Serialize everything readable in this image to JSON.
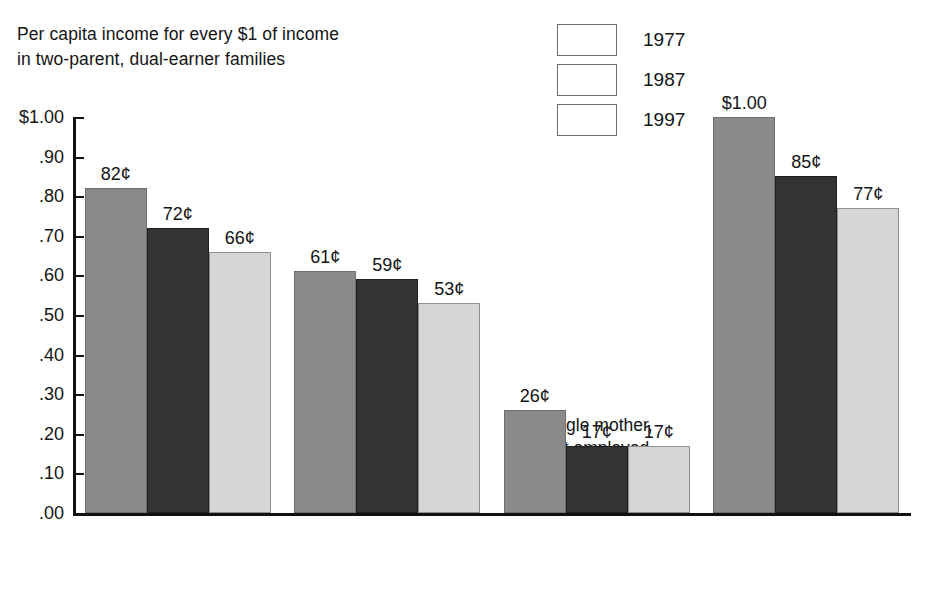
{
  "chart_data": {
    "type": "bar",
    "title": "Per capita income for every $1 of income in two-parent, dual-earner families",
    "title_lines": [
      "Per capita income for every $1 of income",
      "in two-parent, dual-earner families"
    ],
    "xlabel": "",
    "ylabel": "",
    "ylim": [
      0,
      1.0
    ],
    "grid": false,
    "legend_position": "top-center",
    "ytick_labels": [
      "$1.00",
      ".90",
      ".80",
      ".70",
      ".60",
      ".50",
      ".40",
      ".30",
      ".20",
      ".10",
      ".00"
    ],
    "ytick_values": [
      1.0,
      0.9,
      0.8,
      0.7,
      0.6,
      0.5,
      0.4,
      0.3,
      0.2,
      0.1,
      0.0
    ],
    "categories": [
      "Two-parent, father only earner",
      "Single mother, employed",
      "Single mother, not employed",
      "Single father, employed"
    ],
    "category_lines": [
      [
        "Two-parent,",
        "father only earner"
      ],
      [
        "Single mother,",
        "employed"
      ],
      [
        "Single mother,",
        "not employed"
      ],
      [
        "Single father,",
        "employed"
      ]
    ],
    "series": [
      {
        "name": "1977",
        "color": "#8a8a8a",
        "values": [
          0.82,
          0.61,
          0.26,
          1.0
        ],
        "labels": [
          "82¢",
          "61¢",
          "26¢",
          "$1.00"
        ]
      },
      {
        "name": "1987",
        "color": "#333333",
        "values": [
          0.72,
          0.59,
          0.17,
          0.85
        ],
        "labels": [
          "72¢",
          "59¢",
          "17¢",
          "85¢"
        ]
      },
      {
        "name": "1997",
        "color": "#d6d6d6",
        "values": [
          0.66,
          0.53,
          0.17,
          0.77
        ],
        "labels": [
          "66¢",
          "53¢",
          "17¢",
          "77¢"
        ]
      }
    ]
  }
}
